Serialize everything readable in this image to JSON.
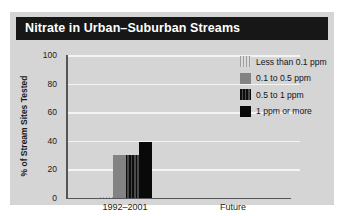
{
  "figure": {
    "title": "Nitrate in Urban–Suburban Streams"
  },
  "chart_data": {
    "type": "bar",
    "title": "Nitrate in Urban–Suburban Streams",
    "xlabel": "",
    "ylabel": "% of Stream Sites Tested",
    "categories": [
      "1992–2001",
      "Future"
    ],
    "ylim": [
      0,
      100
    ],
    "yticks": [
      0,
      20,
      40,
      60,
      80,
      100
    ],
    "ytick_labels": [
      "0",
      "20",
      "40",
      "60",
      "80",
      "100"
    ],
    "grid": true,
    "legend_position": "right",
    "series": [
      {
        "name": "Less than 0.1 ppm",
        "pattern": "light-gray-vertical-stripes",
        "color": "#c9c9c9",
        "values": [
          1,
          0
        ]
      },
      {
        "name": "0.1 to 0.5 ppm",
        "pattern": "solid-medium-gray",
        "color": "#838383",
        "values": [
          30,
          0
        ]
      },
      {
        "name": "0.5 to 1 ppm",
        "pattern": "dark-gray-vertical-stripes",
        "color": "#3a3a3a",
        "values": [
          30,
          0
        ]
      },
      {
        "name": "1 ppm or more",
        "pattern": "solid-black",
        "color": "#090909",
        "values": [
          39,
          0
        ]
      }
    ]
  },
  "legend": {
    "items": [
      {
        "label": "Less than 0.1 ppm"
      },
      {
        "label": "0.1 to 0.5 ppm"
      },
      {
        "label": "0.5 to 1 ppm"
      },
      {
        "label": "1 ppm or more"
      }
    ]
  },
  "axes": {
    "y_label": "% of Stream Sites Tested",
    "y_ticks": [
      "100",
      "80",
      "60",
      "40",
      "20",
      "0"
    ],
    "x_ticks": [
      "1992–2001",
      "Future"
    ]
  }
}
